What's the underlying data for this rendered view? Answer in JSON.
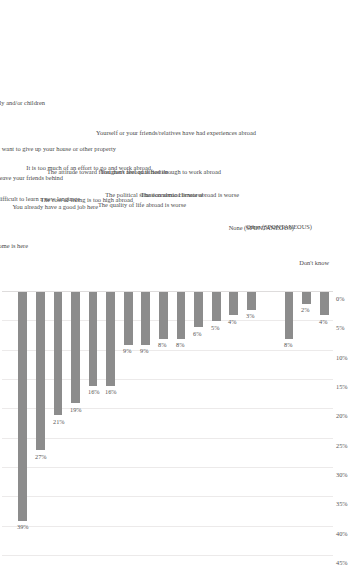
{
  "chart_data": {
    "type": "bar",
    "title": "",
    "subtitle": "",
    "xlabel": "",
    "ylabel": "",
    "orientation": "vertical-rotated",
    "grid": true,
    "legend": "none",
    "ylim": [
      0,
      45
    ],
    "ytick_labels": [
      "0%",
      "5%",
      "10%",
      "15%",
      "20%",
      "25%",
      "30%",
      "35%",
      "40%",
      "45%"
    ],
    "ytick_values": [
      0,
      5,
      10,
      15,
      20,
      25,
      30,
      35,
      40,
      45
    ],
    "value_label_suffix": "%",
    "categories": [
      "Your home is here",
      "You would not want to impose big changes on your family and/or children",
      "You do not want to leave your friends behind",
      "It is difficult to learn a new language",
      "You already have a good job here",
      "You do not want to give up your house or other property",
      "The cost of living is too high abroad",
      "It is too much of an effort to go and work abroad",
      "The attitude toward foreigners abroad is hostile",
      "The quality of life abroad is worse",
      "The political situation abroad is worse",
      "You don't feel qualified enough to work abroad",
      "The economic climate abroad is worse",
      "Yourself or your friends/relatives have had experiences abroad",
      "None (SPONTANEOUS)",
      "Other (SPONTANEOUS)",
      "Don't know"
    ],
    "values": [
      39,
      27,
      21,
      19,
      16,
      16,
      9,
      9,
      8,
      8,
      6,
      5,
      4,
      3,
      8,
      2,
      4
    ],
    "value_labels": [
      "39%",
      "27%",
      "21%",
      "19%",
      "16%",
      "16%",
      "9%",
      "9%",
      "8%",
      "8%",
      "6%",
      "5%",
      "4%",
      "3%",
      "8%",
      "2%",
      "4%"
    ],
    "gap_after_index": 13,
    "colors": {
      "bar": "#8c8c8c",
      "grid": "#eceaea",
      "baseline": "#dedcdc",
      "text": "#4a4a4a",
      "background": "#ffffff"
    }
  }
}
